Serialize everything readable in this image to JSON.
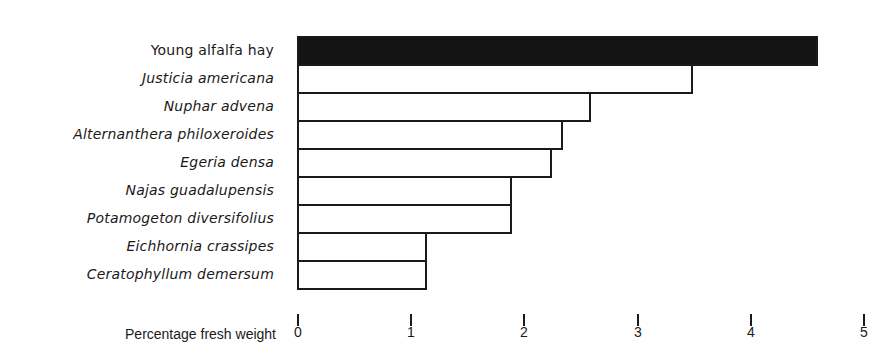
{
  "chart_data": {
    "type": "bar",
    "orientation": "horizontal",
    "title": "",
    "xlabel": "Percentage fresh weight",
    "ylabel": "",
    "xlim": [
      0,
      5
    ],
    "x_ticks": [
      "0",
      "1",
      "2",
      "3",
      "4",
      "5"
    ],
    "grid": false,
    "legend": null,
    "categories": [
      "Young alfalfa hay",
      "Justicia americana",
      "Nuphar advena",
      "Alternanthera philoxeroides",
      "Egeria densa",
      "Najas guadalupensis",
      "Potamogeton diversifolius",
      "Eichhornia crassipes",
      "Ceratophyllum demersum"
    ],
    "values": [
      4.6,
      3.5,
      2.6,
      2.35,
      2.25,
      1.9,
      1.9,
      1.15,
      1.15
    ],
    "italic": [
      false,
      true,
      true,
      true,
      true,
      true,
      true,
      true,
      true
    ],
    "fill": [
      "#141414",
      "#ffffff",
      "#ffffff",
      "#ffffff",
      "#ffffff",
      "#ffffff",
      "#ffffff",
      "#ffffff",
      "#ffffff"
    ]
  },
  "axis": {
    "title": "Percentage fresh weight",
    "ticks": [
      "0",
      "1",
      "2",
      "3",
      "4",
      "5"
    ]
  },
  "labels": {
    "0": "Young alfalfa hay",
    "1": "Justicia americana",
    "2": "Nuphar advena",
    "3": "Alternanthera philoxeroides",
    "4": "Egeria densa",
    "5": "Najas guadalupensis",
    "6": "Potamogeton diversifolius",
    "7": "Eichhornia crassipes",
    "8": "Ceratophyllum demersum"
  }
}
